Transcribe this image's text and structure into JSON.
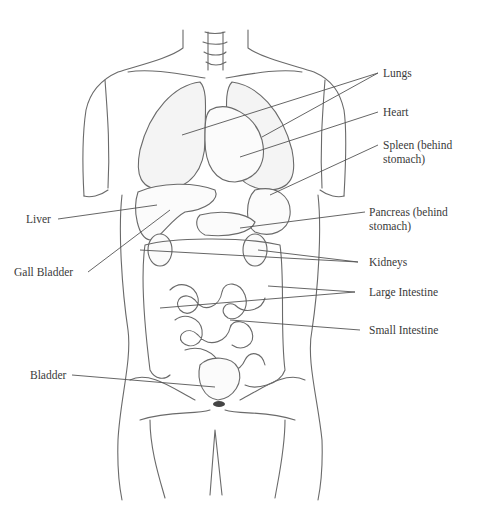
{
  "diagram": {
    "labels": [
      {
        "id": "lungs",
        "text": "Lungs"
      },
      {
        "id": "heart",
        "text": "Heart"
      },
      {
        "id": "spleen",
        "text": "Spleen (behind",
        "text2": "stomach)"
      },
      {
        "id": "liver",
        "text": "Liver"
      },
      {
        "id": "pancreas",
        "text": "Pancreas (behind",
        "text2": "stomach)"
      },
      {
        "id": "gall-bladder",
        "text": "Gall Bladder"
      },
      {
        "id": "kidneys",
        "text": "Kidneys"
      },
      {
        "id": "large-intestine",
        "text": "Large Intestine"
      },
      {
        "id": "small-intestine",
        "text": "Small Intestine"
      },
      {
        "id": "bladder",
        "text": "Bladder"
      }
    ],
    "colors": {
      "line": "#555555",
      "text": "#3a3a3a",
      "background": "#ffffff"
    }
  }
}
